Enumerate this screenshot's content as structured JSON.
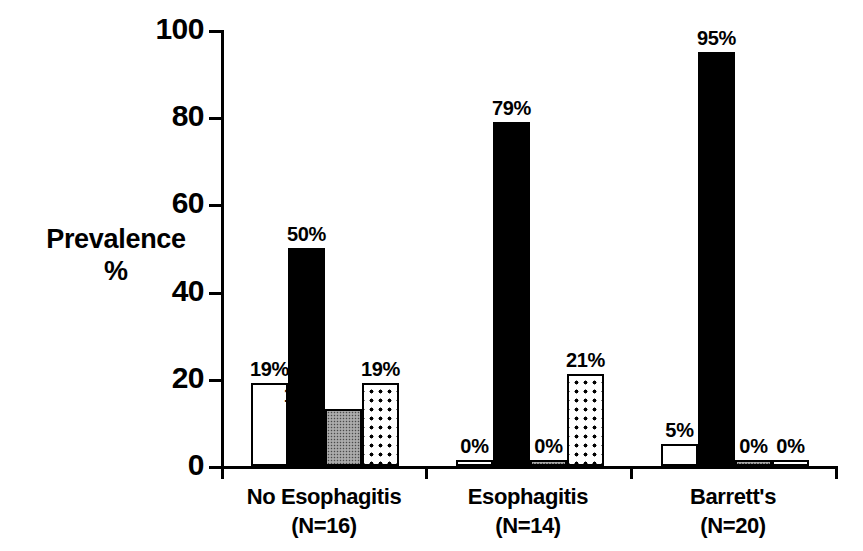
{
  "chart_data": {
    "type": "bar",
    "title": "",
    "subtitle": "",
    "xlabel": "",
    "ylabel": "Prevalence %",
    "ylabel_lines": [
      "Prevalence",
      "%"
    ],
    "ylim": [
      0,
      100
    ],
    "yticks": [
      0,
      20,
      40,
      60,
      80,
      100
    ],
    "ytick_labels": [
      "0",
      "20",
      "40",
      "60",
      "80",
      "100"
    ],
    "grid": false,
    "legend": "none",
    "categories": [
      "No Esophagitis",
      "Esophagitis",
      "Barrett's"
    ],
    "category_counts": [
      "(N=16)",
      "(N=14)",
      "(N=20)"
    ],
    "series": [
      {
        "name": "series-1",
        "style": "open",
        "values": [
          19,
          0,
          5
        ],
        "labels": [
          "19%",
          "0%",
          "5%"
        ]
      },
      {
        "name": "series-2",
        "style": "solid",
        "values": [
          50,
          79,
          95
        ],
        "labels": [
          "50%",
          "79%",
          "95%"
        ]
      },
      {
        "name": "series-3",
        "style": "stipple",
        "values": [
          13,
          0,
          0
        ],
        "labels": [
          "13%",
          "0%",
          "0%"
        ]
      },
      {
        "name": "series-4",
        "style": "dotted",
        "values": [
          19,
          21,
          0
        ],
        "labels": [
          "19%",
          "21%",
          "0%"
        ]
      }
    ],
    "groups": [
      {
        "category": "No Esophagitis",
        "count": "(N=16)",
        "bars": [
          {
            "style": "open",
            "value": 19,
            "label": "19%",
            "label_position": "above"
          },
          {
            "style": "solid",
            "value": 50,
            "label": "50%",
            "label_position": "above"
          },
          {
            "style": "stipple",
            "value": 13,
            "label": "13%",
            "label_position": "above-left"
          },
          {
            "style": "dotted",
            "value": 19,
            "label": "19%",
            "label_position": "above"
          }
        ]
      },
      {
        "category": "Esophagitis",
        "count": "(N=14)",
        "bars": [
          {
            "style": "open",
            "value": 0,
            "label": "0%",
            "label_position": "above"
          },
          {
            "style": "solid",
            "value": 79,
            "label": "79%",
            "label_position": "above"
          },
          {
            "style": "stipple",
            "value": 0,
            "label": "0%",
            "label_position": "above"
          },
          {
            "style": "dotted",
            "value": 21,
            "label": "21%",
            "label_position": "above"
          }
        ]
      },
      {
        "category": "Barrett's",
        "count": "(N=20)",
        "bars": [
          {
            "style": "open",
            "value": 5,
            "label": "5%",
            "label_position": "above"
          },
          {
            "style": "solid",
            "value": 95,
            "label": "95%",
            "label_position": "above"
          },
          {
            "style": "stipple",
            "value": 0,
            "label": "0%",
            "label_position": "above"
          },
          {
            "style": "dotted",
            "value": 0,
            "label": "0%",
            "label_position": "above"
          }
        ]
      }
    ],
    "colors": {
      "axis": "#000000",
      "text": "#000000",
      "background": "#ffffff",
      "solid_bar": "#000000",
      "open_bar": "#ffffff",
      "stipple_bar": "#9a9a9a",
      "dotted_bar": "#ffffff"
    }
  }
}
